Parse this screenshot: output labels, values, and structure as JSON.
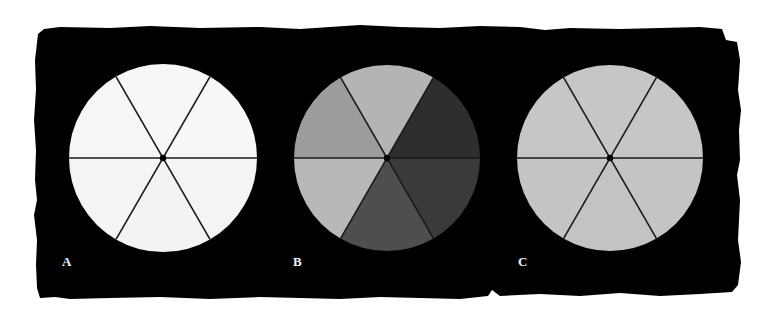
{
  "figure": {
    "background_color": "#ffffff",
    "mat_color": "#000000",
    "divider_color": "#1a1a1a",
    "panels": [
      {
        "label": "A",
        "center": [
          163,
          158
        ],
        "radius": 94,
        "sector_fills": [
          "#f7f7f7",
          "#f7f7f7",
          "#f4f4f4",
          "#f3f3f3",
          "#f4f4f4",
          "#f6f6f6"
        ]
      },
      {
        "label": "B",
        "center": [
          387,
          158
        ],
        "radius": 93,
        "sector_fills": [
          "#b4b4b4",
          "#2e2e2e",
          "#3a3a3a",
          "#4e4e4e",
          "#b8b8b8",
          "#9c9c9c"
        ]
      },
      {
        "label": "C",
        "center": [
          610,
          158
        ],
        "radius": 93,
        "sector_fills": [
          "#c6c6c6",
          "#c6c6c6",
          "#c4c4c4",
          "#c3c3c3",
          "#c4c4c4",
          "#c6c6c6"
        ]
      }
    ],
    "sector_order_note": "sectors listed clockwise starting from top sector (between 12 and 2 o'clock dividers ±30deg)"
  }
}
